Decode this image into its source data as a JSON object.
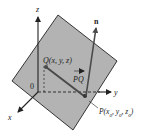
{
  "diagram": {
    "type": "3d-plane-normal-vector",
    "plane_color": "#b3b3b3",
    "plane_edge_color": "#222222",
    "axis_color": "#222222",
    "vector_color": "#4a4a4a",
    "labels": {
      "z_axis": "z",
      "y_axis": "y",
      "x_axis": "x",
      "origin": "0",
      "normal": "n",
      "point_q": "Q(x, y, z)",
      "vector_pq": "PQ",
      "point_p_prefix": "P(x",
      "point_p_sub0": "0",
      "point_p_mid1": ", y",
      "point_p_sub1": "0",
      "point_p_mid2": ", z",
      "point_p_sub2": "0",
      "point_p_suffix": ")"
    }
  }
}
